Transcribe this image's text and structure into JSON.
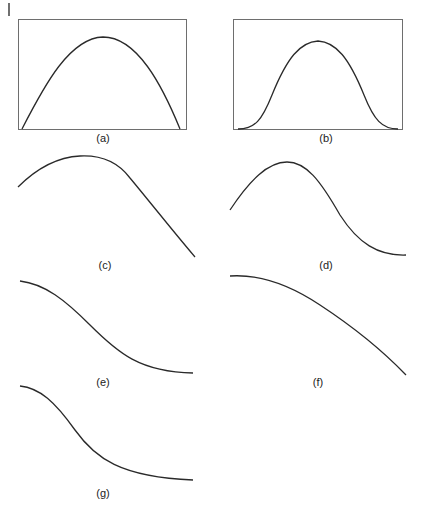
{
  "figure": {
    "panels": [
      {
        "id": "a",
        "label": "(a)",
        "framed": true,
        "shape": "parabolic arch (peak centered, steep ends touching baseline)"
      },
      {
        "id": "b",
        "label": "(b)",
        "framed": true,
        "shape": "bell / Gaussian-like curve (flat tails at baseline)"
      },
      {
        "id": "c",
        "label": "(c)",
        "framed": false,
        "shape": "rising arc peaking left of center then near-linear descent"
      },
      {
        "id": "d",
        "label": "(d)",
        "framed": false,
        "shape": "rise to peak left of center then S-shaped descent to flat tail"
      },
      {
        "id": "e",
        "label": "(e)",
        "framed": false,
        "shape": "decreasing sigmoid from flat top to flat bottom"
      },
      {
        "id": "f",
        "label": "(f)",
        "framed": false,
        "shape": "concave-down monotonically decreasing curve"
      },
      {
        "id": "g",
        "label": "(g)",
        "framed": false,
        "shape": "decreasing sigmoid, steeper early drop, long flat tail"
      }
    ]
  },
  "colors": {
    "curve": "#2a2a2a",
    "frame": "#6e6e6e",
    "background": "#ffffff"
  }
}
